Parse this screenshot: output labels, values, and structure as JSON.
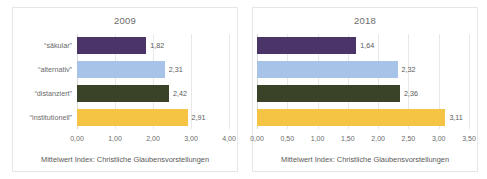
{
  "chart_data": [
    {
      "type": "bar",
      "orientation": "horizontal",
      "title": "2009",
      "categories": [
        "“säkular”",
        "“alternativ”",
        "“distanziert”",
        "“institutionell”"
      ],
      "values": [
        1.82,
        2.31,
        2.42,
        2.91
      ],
      "value_labels": [
        "1,82",
        "2,31",
        "2,42",
        "2,91"
      ],
      "colors": [
        "#4b3468",
        "#a8c3e8",
        "#3a4228",
        "#f6c košice"
      ],
      "bar_colors": [
        "#4b3468",
        "#a8c3e8",
        "#3a4228",
        "#f6c445"
      ],
      "xlabel": "Mittelwert Index: Christliche Glaubensvorstellungen",
      "ylabel": "",
      "xlim": [
        0,
        4
      ],
      "xticks": [
        0,
        1,
        2,
        3,
        4
      ],
      "xtick_labels": [
        "0,00",
        "1,00",
        "2,00",
        "3,00",
        "4,00"
      ],
      "grid": true,
      "legend": false,
      "show_category_labels": true
    },
    {
      "type": "bar",
      "orientation": "horizontal",
      "title": "2018",
      "categories": [
        "“säkular”",
        "“alternativ”",
        "“distanziert”",
        "“institutionell”"
      ],
      "values": [
        1.64,
        2.32,
        2.36,
        3.11
      ],
      "value_labels": [
        "1,64",
        "2,32",
        "2,36",
        "3,11"
      ],
      "bar_colors": [
        "#4b3468",
        "#a8c3e8",
        "#3a4228",
        "#f6c445"
      ],
      "xlabel": "Mittelwert Index: Christliche Glaubensvorstellungen",
      "ylabel": "",
      "xlim": [
        0,
        3.5
      ],
      "xticks": [
        0,
        0.5,
        1,
        1.5,
        2,
        2.5,
        3,
        3.5
      ],
      "xtick_labels": [
        "0,00",
        "0,50",
        "1,00",
        "1,50",
        "2,00",
        "2,50",
        "3,00",
        "3,50"
      ],
      "grid": true,
      "legend": false,
      "show_category_labels": false
    }
  ]
}
